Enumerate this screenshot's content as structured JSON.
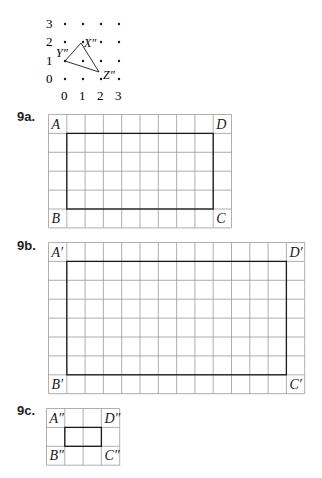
{
  "dot_grid": {
    "y_labels": [
      "3",
      "2",
      "1",
      "0"
    ],
    "x_labels": [
      "0",
      "1",
      "2",
      "3"
    ],
    "triangle": {
      "vertices": [
        {
          "label": "X″",
          "x": 81,
          "y": 43
        },
        {
          "label": "Y″",
          "x": 65,
          "y": 61
        },
        {
          "label": "Z″",
          "x": 99,
          "y": 72
        }
      ]
    }
  },
  "problems": [
    {
      "label": "9a.",
      "cols": 10,
      "rows": 6,
      "rect": {
        "c0": 1,
        "r0": 1,
        "c1": 9,
        "r1": 5
      },
      "corners": {
        "tl": "A",
        "tr": "D",
        "bl": "B",
        "br": "C"
      }
    },
    {
      "label": "9b.",
      "cols": 14,
      "rows": 8,
      "rect": {
        "c0": 1,
        "r0": 1,
        "c1": 13,
        "r1": 7
      },
      "corners": {
        "tl": "A′",
        "tr": "D′",
        "bl": "B′",
        "br": "C′"
      }
    },
    {
      "label": "9c.",
      "cols": 4,
      "rows": 3,
      "rect": {
        "c0": 1,
        "r0": 1,
        "c1": 3,
        "r1": 2
      },
      "corners": {
        "tl": "A″",
        "tr": "D″",
        "bl": "B″",
        "br": "C″"
      }
    }
  ],
  "colors": {
    "grid_line": "#9a9a9a",
    "rect_line": "#1a1a1a",
    "text": "#1a1a1a"
  }
}
